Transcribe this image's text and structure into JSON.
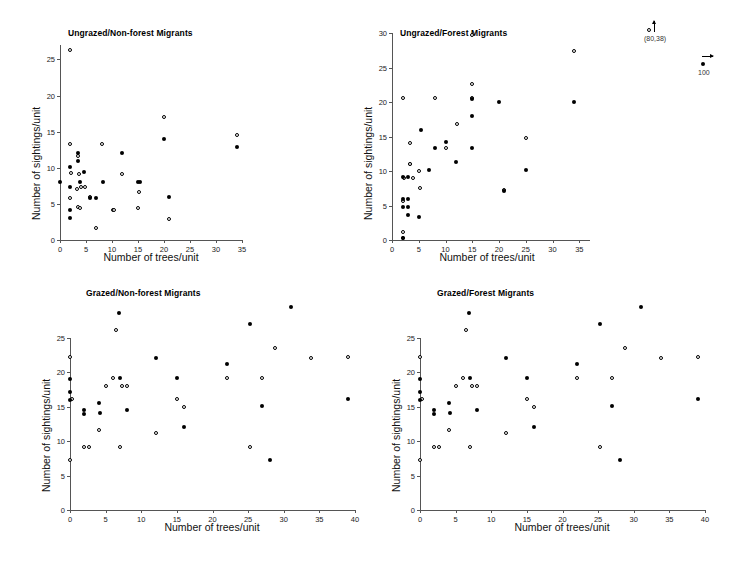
{
  "figure": {
    "panel_count": 4,
    "x_axis_title": "Number of trees/unit",
    "y_axis_title": "Number of sightings/unit"
  },
  "chart_data": [
    {
      "id": "ungrazed-non-forest",
      "type": "scatter",
      "title": "Ungrazed/Non-forest Migrants",
      "xlabel": "Number of trees/unit",
      "ylabel": "Number of sightings/unit",
      "xlim": [
        0,
        35
      ],
      "ylim": [
        0,
        27
      ],
      "xticks": [
        0,
        5,
        10,
        15,
        20,
        25,
        30,
        35
      ],
      "yticks": [
        0,
        5,
        10,
        15,
        20,
        25
      ],
      "grid": false,
      "legend": "none",
      "series": [
        {
          "name": "open",
          "marker": "open-circle",
          "points": [
            [
              2.0,
              26.3
            ],
            [
              2.0,
              13.3
            ],
            [
              2.2,
              9.3
            ],
            [
              3.4,
              11.6
            ],
            [
              3.6,
              9.1
            ],
            [
              2.0,
              5.8
            ],
            [
              3.3,
              7.1
            ],
            [
              4.0,
              7.3
            ],
            [
              4.9,
              7.3
            ],
            [
              3.4,
              4.6
            ],
            [
              3.9,
              4.5
            ],
            [
              5.7,
              6.0
            ],
            [
              7.0,
              1.6
            ],
            [
              8.0,
              13.3
            ],
            [
              10.1,
              4.2
            ],
            [
              10.4,
              4.2
            ],
            [
              12.0,
              9.1
            ],
            [
              15.1,
              6.6
            ],
            [
              15.0,
              4.5
            ],
            [
              20.0,
              17.1
            ],
            [
              21.0,
              2.9
            ],
            [
              34.0,
              14.5
            ]
          ]
        },
        {
          "name": "filled",
          "marker": "filled-circle",
          "points": [
            [
              0.0,
              8.1
            ],
            [
              2.0,
              10.1
            ],
            [
              2.0,
              7.4
            ],
            [
              2.0,
              4.1
            ],
            [
              2.0,
              3.0
            ],
            [
              3.5,
              12.1
            ],
            [
              3.5,
              11.0
            ],
            [
              3.9,
              8.1
            ],
            [
              4.6,
              9.4
            ],
            [
              5.8,
              5.8
            ],
            [
              6.9,
              5.8
            ],
            [
              8.2,
              8.0
            ],
            [
              12.0,
              12.0
            ],
            [
              15.0,
              8.0
            ],
            [
              15.3,
              8.0
            ],
            [
              20.0,
              14.0
            ],
            [
              21.0,
              6.0
            ],
            [
              34.0,
              12.9
            ]
          ]
        }
      ]
    },
    {
      "id": "ungrazed-forest",
      "type": "scatter",
      "title": "Ungrazed/Forest Migrants",
      "xlabel": "Number of trees/unit",
      "ylabel": "Number of sightings/unit",
      "xlim": [
        0,
        37
      ],
      "ylim": [
        0,
        30
      ],
      "xticks": [
        0,
        5,
        10,
        15,
        20,
        25,
        30,
        35
      ],
      "yticks": [
        0,
        5,
        10,
        15,
        20,
        25,
        30
      ],
      "grid": false,
      "legend": "none",
      "annotations": [
        {
          "label": "(80,38)",
          "marker": "open-circle",
          "arrow": "up"
        },
        {
          "label": "100",
          "marker": "filled-circle",
          "arrow": "right"
        }
      ],
      "series": [
        {
          "name": "open",
          "marker": "open-circle",
          "points": [
            [
              2.0,
              20.6
            ],
            [
              8.0,
              20.6
            ],
            [
              15.0,
              20.6
            ],
            [
              15.0,
              22.6
            ],
            [
              12.2,
              16.8
            ],
            [
              10.0,
              13.3
            ],
            [
              3.3,
              14.0
            ],
            [
              3.3,
              11.0
            ],
            [
              2.2,
              9.0
            ],
            [
              3.4,
              11.0
            ],
            [
              5.0,
              10.0
            ],
            [
              4.0,
              9.0
            ],
            [
              5.2,
              7.5
            ],
            [
              2.0,
              5.6
            ],
            [
              2.0,
              1.1
            ],
            [
              2.0,
              0.3
            ],
            [
              21.0,
              7.3
            ],
            [
              25.0,
              14.8
            ],
            [
              34.0,
              27.4
            ],
            [
              15.0,
              29.7
            ]
          ]
        },
        {
          "name": "filled",
          "marker": "filled-circle",
          "points": [
            [
              5.5,
              16.0
            ],
            [
              8.0,
              13.3
            ],
            [
              10.0,
              14.2
            ],
            [
              12.0,
              11.3
            ],
            [
              15.0,
              13.3
            ],
            [
              15.0,
              18.0
            ],
            [
              15.0,
              20.5
            ],
            [
              20.0,
              20.0
            ],
            [
              2.0,
              9.2
            ],
            [
              3.0,
              9.2
            ],
            [
              2.0,
              6.0
            ],
            [
              3.0,
              6.0
            ],
            [
              2.0,
              4.8
            ],
            [
              3.0,
              4.8
            ],
            [
              3.0,
              3.6
            ],
            [
              5.0,
              3.4
            ],
            [
              7.0,
              10.2
            ],
            [
              21.0,
              7.1
            ],
            [
              25.0,
              10.2
            ],
            [
              34.0,
              20.0
            ],
            [
              2.0,
              0.3
            ]
          ]
        }
      ]
    },
    {
      "id": "grazed-non-forest",
      "type": "scatter",
      "title": "Grazed/Non-forest Migrants",
      "xlabel": "Number of trees/unit",
      "ylabel": "Number of sightings/unit",
      "xlim": [
        0,
        40
      ],
      "ylim": [
        0,
        25
      ],
      "xticks": [
        0,
        5,
        10,
        15,
        20,
        25,
        30,
        35,
        40
      ],
      "yticks": [
        0,
        5,
        10,
        15,
        20,
        25
      ],
      "grid": false,
      "legend": "none",
      "series": [
        {
          "name": "open",
          "marker": "open-circle",
          "points": [
            [
              0.0,
              22.2
            ],
            [
              0.3,
              16.1
            ],
            [
              0.0,
              7.3
            ],
            [
              2.0,
              9.1
            ],
            [
              2.6,
              9.1
            ],
            [
              4.0,
              11.7
            ],
            [
              5.0,
              18.0
            ],
            [
              6.0,
              19.2
            ],
            [
              6.4,
              26.1
            ],
            [
              7.0,
              9.2
            ],
            [
              7.3,
              18.0
            ],
            [
              8.0,
              18.0
            ],
            [
              12.0,
              11.2
            ],
            [
              15.0,
              16.2
            ],
            [
              16.0,
              14.9
            ],
            [
              22.0,
              19.2
            ],
            [
              25.3,
              9.1
            ],
            [
              27.0,
              19.2
            ],
            [
              28.8,
              23.5
            ],
            [
              33.8,
              22.1
            ],
            [
              39.0,
              22.2
            ]
          ]
        },
        {
          "name": "filled",
          "marker": "filled-circle",
          "points": [
            [
              0.0,
              19.0
            ],
            [
              0.0,
              17.1
            ],
            [
              0.0,
              16.0
            ],
            [
              2.0,
              14.6
            ],
            [
              2.0,
              14.0
            ],
            [
              4.0,
              15.6
            ],
            [
              4.2,
              14.1
            ],
            [
              6.9,
              28.7
            ],
            [
              7.0,
              19.2
            ],
            [
              8.0,
              14.6
            ],
            [
              12.0,
              22.1
            ],
            [
              15.0,
              19.2
            ],
            [
              16.0,
              12.1
            ],
            [
              22.0,
              21.2
            ],
            [
              25.2,
              27.0
            ],
            [
              27.0,
              15.1
            ],
            [
              28.0,
              7.2
            ],
            [
              31.0,
              29.5
            ],
            [
              39.0,
              16.1
            ]
          ]
        }
      ]
    },
    {
      "id": "grazed-forest",
      "type": "scatter",
      "title": "Grazed/Forest Migrants",
      "xlabel": "Number of trees/unit",
      "ylabel": "Number of sightings/unit",
      "xlim": [
        0,
        40
      ],
      "ylim": [
        0,
        25
      ],
      "xticks": [
        0,
        5,
        10,
        15,
        20,
        25,
        30,
        35,
        40
      ],
      "yticks": [
        0,
        5,
        10,
        15,
        20,
        25
      ],
      "grid": false,
      "legend": "none",
      "series": [
        {
          "name": "open",
          "marker": "open-circle",
          "points": [
            [
              0.0,
              22.2
            ],
            [
              0.3,
              16.1
            ],
            [
              0.0,
              7.3
            ],
            [
              2.0,
              9.1
            ],
            [
              2.6,
              9.1
            ],
            [
              4.0,
              11.7
            ],
            [
              5.0,
              18.0
            ],
            [
              6.0,
              19.2
            ],
            [
              6.4,
              26.1
            ],
            [
              7.0,
              9.2
            ],
            [
              7.3,
              18.0
            ],
            [
              8.0,
              18.0
            ],
            [
              12.0,
              11.2
            ],
            [
              15.0,
              16.2
            ],
            [
              16.0,
              14.9
            ],
            [
              22.0,
              19.2
            ],
            [
              25.3,
              9.1
            ],
            [
              27.0,
              19.2
            ],
            [
              28.8,
              23.5
            ],
            [
              33.8,
              22.1
            ],
            [
              39.0,
              22.2
            ]
          ]
        },
        {
          "name": "filled",
          "marker": "filled-circle",
          "points": [
            [
              0.0,
              19.0
            ],
            [
              0.0,
              17.1
            ],
            [
              0.0,
              16.0
            ],
            [
              2.0,
              14.6
            ],
            [
              2.0,
              14.0
            ],
            [
              4.0,
              15.6
            ],
            [
              4.2,
              14.1
            ],
            [
              6.9,
              28.7
            ],
            [
              7.0,
              19.2
            ],
            [
              8.0,
              14.6
            ],
            [
              12.0,
              22.1
            ],
            [
              15.0,
              19.2
            ],
            [
              16.0,
              12.1
            ],
            [
              22.0,
              21.2
            ],
            [
              25.2,
              27.0
            ],
            [
              27.0,
              15.1
            ],
            [
              28.0,
              7.2
            ],
            [
              31.0,
              29.5
            ],
            [
              39.0,
              16.1
            ]
          ]
        }
      ]
    }
  ]
}
